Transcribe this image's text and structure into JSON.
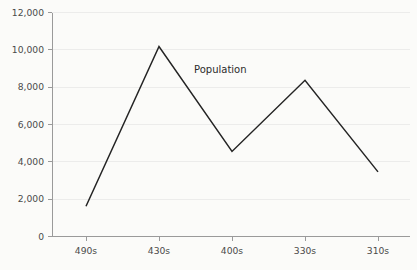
{
  "chart_data": {
    "type": "line",
    "title": "",
    "subtitle": "",
    "xlabel": "",
    "ylabel": "",
    "categories": [
      "490s",
      "430s",
      "400s",
      "330s",
      "310s"
    ],
    "series": [
      {
        "name": "Population",
        "values": [
          1600,
          10200,
          4550,
          8380,
          3450
        ]
      }
    ],
    "ylim": [
      0,
      12000
    ],
    "y_ticks": [
      0,
      2000,
      4000,
      6000,
      8000,
      10000,
      12000
    ],
    "y_tick_labels": [
      "0",
      "2,000",
      "4,000",
      "6,000",
      "8,000",
      "10,000",
      "12,000"
    ],
    "x_tick_labels": [
      "490s",
      "430s",
      "400s",
      "330s",
      "310s"
    ],
    "grid": true,
    "grid_axis": "y",
    "legend": "inline-label",
    "legend_position": "inside-upper-center",
    "annotations": [
      {
        "text": "Population",
        "x_px": 194,
        "y_px": 73
      }
    ],
    "colors": {
      "line": "#242424",
      "background": "#fbfbf9",
      "axis": "#9a9a9a",
      "gridline": "#ececeb",
      "tick_text": "#4a4a4a",
      "label_text": "#2b2b2b"
    },
    "geometry": {
      "plot_left": 52,
      "plot_right": 410,
      "plot_top": 13,
      "plot_bottom": 236,
      "x_positions": [
        86,
        159,
        232,
        305,
        378
      ]
    }
  }
}
